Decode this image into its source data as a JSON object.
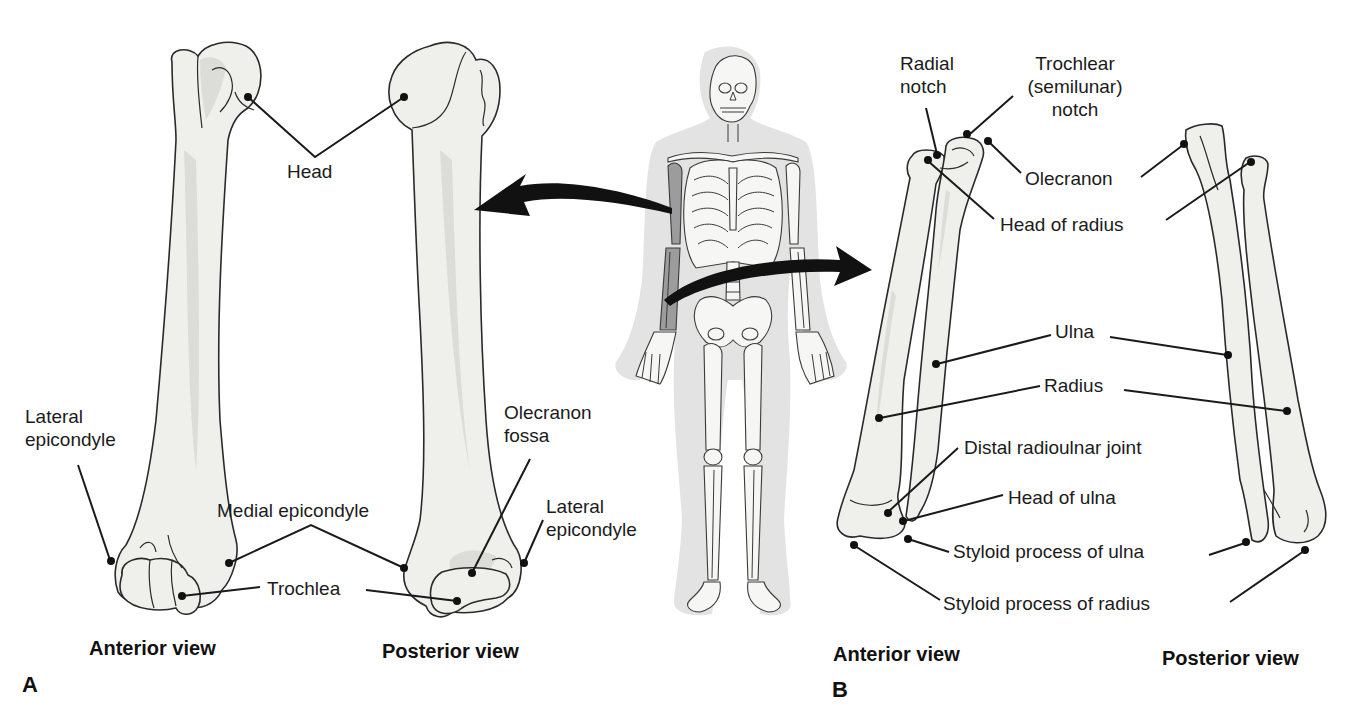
{
  "figure": {
    "panels": [
      {
        "id": "A",
        "letter": "A",
        "subject": "humerus",
        "views": [
          {
            "label": "Anterior view"
          },
          {
            "label": "Posterior view"
          }
        ],
        "labels": {
          "head": "Head",
          "lateral_epicondyle_anterior_line1": "Lateral",
          "lateral_epicondyle_anterior_line2": "epicondyle",
          "medial_epicondyle": "Medial epicondyle",
          "trochlea": "Trochlea",
          "olecranon_fossa_line1": "Olecranon",
          "olecranon_fossa_line2": "fossa",
          "lateral_epicondyle_posterior_line1": "Lateral",
          "lateral_epicondyle_posterior_line2": "epicondyle"
        }
      },
      {
        "id": "B",
        "letter": "B",
        "subject": "radius and ulna",
        "views": [
          {
            "label": "Anterior view"
          },
          {
            "label": "Posterior view"
          }
        ],
        "labels": {
          "radial_notch_line1": "Radial",
          "radial_notch_line2": "notch",
          "trochlear_notch_line1": "Trochlear",
          "trochlear_notch_line2": "(semilunar)",
          "trochlear_notch_line3": "notch",
          "olecranon": "Olecranon",
          "head_of_radius": "Head of radius",
          "ulna": "Ulna",
          "radius": "Radius",
          "distal_radioulnar_joint": "Distal radioulnar joint",
          "head_of_ulna": "Head of ulna",
          "styloid_process_of_ulna": "Styloid process of ulna",
          "styloid_process_of_radius": "Styloid process of radius"
        }
      }
    ],
    "skeleton": {
      "highlighted_bones": [
        "humerus",
        "radius",
        "ulna"
      ],
      "arrows": [
        "to-humerus-panel",
        "to-forearm-panel"
      ]
    },
    "colors": {
      "bone_fill": "#efefec",
      "outline": "#2a2a2a",
      "silhouette": "#e3e3e3",
      "highlight": "#9c9c9c"
    }
  }
}
